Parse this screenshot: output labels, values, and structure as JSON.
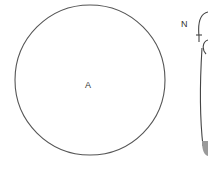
{
  "diagram": {
    "circle_label": "A",
    "tube_label": "N",
    "colors": {
      "stroke": "#555555",
      "fill_bottom": "#9a9a9a",
      "background": "#ffffff"
    }
  }
}
